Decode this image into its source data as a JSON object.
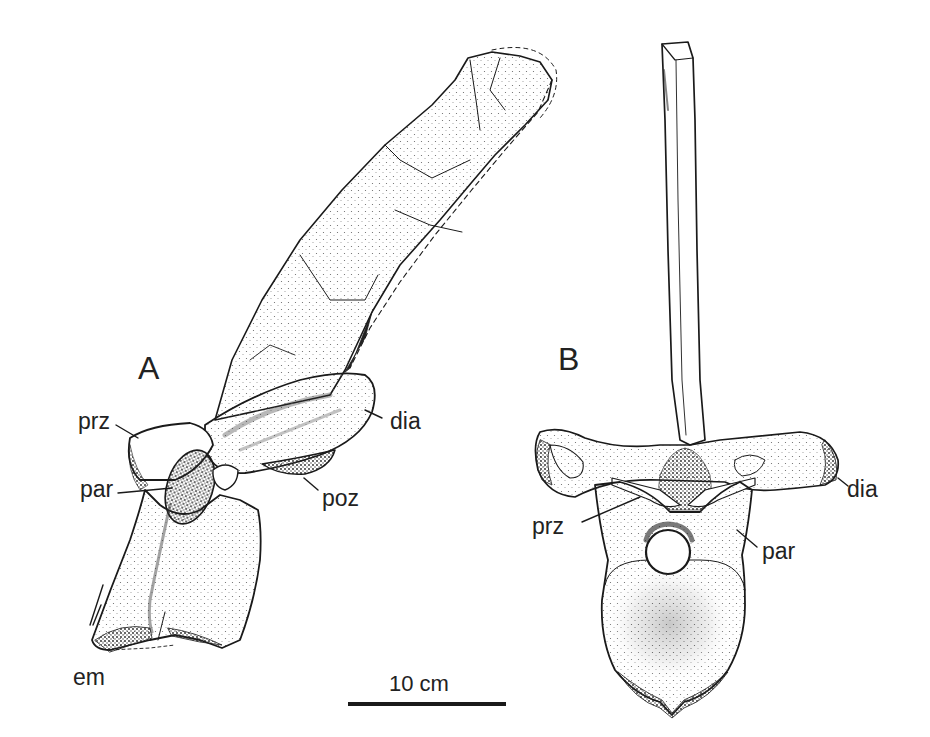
{
  "figure": {
    "panels": [
      {
        "id": "A",
        "label": "A",
        "view": "lateral"
      },
      {
        "id": "B",
        "label": "B",
        "view": "anterior"
      }
    ],
    "panel_a_annotations": [
      {
        "key": "prz",
        "text": "prz"
      },
      {
        "key": "par",
        "text": "par"
      },
      {
        "key": "em",
        "text": "em"
      },
      {
        "key": "dia",
        "text": "dia"
      },
      {
        "key": "poz",
        "text": "poz"
      }
    ],
    "panel_b_annotations": [
      {
        "key": "dia",
        "text": "dia"
      },
      {
        "key": "prz",
        "text": "prz"
      },
      {
        "key": "par",
        "text": "par"
      }
    ],
    "scale_bar": {
      "label": "10 cm"
    },
    "colors": {
      "ink": "#1a1a1a",
      "background": "#ffffff",
      "stipple": "#555555"
    }
  }
}
